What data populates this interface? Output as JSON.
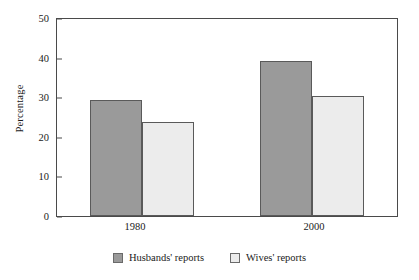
{
  "chart_data": {
    "type": "bar",
    "title": "",
    "xlabel": "",
    "ylabel": "Percentage",
    "categories": [
      "1980",
      "2000"
    ],
    "series": [
      {
        "name": "Husbands' reports",
        "values": [
          29.4,
          39.4
        ],
        "color": "#9a9a9a"
      },
      {
        "name": "Wives' reports",
        "values": [
          23.9,
          30.4
        ],
        "color": "#ececec"
      }
    ],
    "ylim": [
      0,
      50
    ],
    "yticks": [
      0,
      10,
      20,
      30,
      40,
      50
    ],
    "ytick_labels": [
      "0",
      "10",
      "20",
      "30",
      "40",
      "50"
    ],
    "grid": false,
    "legend_position": "bottom"
  },
  "axis": {
    "y_title": "Percentage",
    "y_ticks": [
      "50",
      "40",
      "30",
      "20",
      "10",
      "0"
    ],
    "x_ticks": [
      "1980",
      "2000"
    ]
  },
  "legend": {
    "items": [
      {
        "label": "Husbands' reports",
        "swatch": "dark"
      },
      {
        "label": "Wives' reports",
        "swatch": "light"
      }
    ]
  }
}
